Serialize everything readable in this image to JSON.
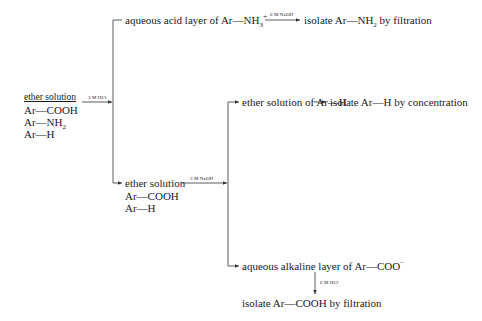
{
  "start": {
    "title": "ether solution",
    "compounds": [
      "Ar—COOH",
      "Ar—NH",
      "Ar—H"
    ]
  },
  "step1": {
    "reagent": "3 M HCl",
    "upper": {
      "text_pre": "aqueous acid layer of Ar—NH",
      "sub": "3",
      "sup": "+",
      "reagent": "6 M NaOH",
      "result_pre": "isolate Ar—NH",
      "result_sub": "2",
      "result_post": " by filtration"
    },
    "lower": {
      "title": "ether solution",
      "compounds": [
        "Ar—COOH",
        "Ar—H"
      ]
    }
  },
  "step2": {
    "reagent": "3 M NaOH",
    "upper": {
      "text": "ether solution of Ar—H",
      "result": "isolate Ar—H by concentration"
    },
    "lower": {
      "text_pre": "aqueous alkaline layer of Ar—COO",
      "sup": "−",
      "reagent": "6 M HCl",
      "result": "isolate Ar—COOH by filtration"
    }
  },
  "subscript_nh2": "2"
}
